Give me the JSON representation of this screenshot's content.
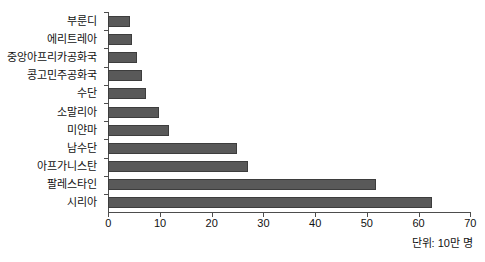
{
  "chart_data": {
    "type": "bar",
    "orientation": "horizontal",
    "title": "",
    "xlabel": "",
    "ylabel": "",
    "categories": [
      "부룬디",
      "에리트레아",
      "중앙아프리카공화국",
      "콩고민주공화국",
      "수단",
      "소말리아",
      "미얀마",
      "남수단",
      "아프가니스탄",
      "팔레스타인",
      "시리아"
    ],
    "values": [
      4.2,
      4.6,
      5.6,
      6.6,
      7.3,
      9.9,
      11.7,
      24.8,
      27.1,
      51.8,
      62.5
    ],
    "xlim": [
      0,
      70
    ],
    "xticks": [
      0,
      10,
      20,
      30,
      40,
      50,
      60,
      70
    ],
    "xtick_labels": [
      "0",
      "10",
      "20",
      "30",
      "40",
      "50",
      "60",
      "70"
    ],
    "grid": false,
    "legend": null,
    "annotation": "단위: 10만 명",
    "colors": {
      "bar_fill": "#595959",
      "bar_stroke": "#3d3d3d",
      "axis": "#4d4d4d",
      "text": "#111111",
      "background": "#ffffff"
    }
  }
}
